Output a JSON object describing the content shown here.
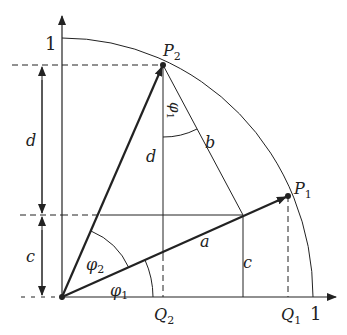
{
  "diagram": {
    "axis_labels": {
      "y_one": "1",
      "x_one": "1"
    },
    "points": {
      "P1": {
        "label": "P",
        "sub": "1"
      },
      "P2": {
        "label": "P",
        "sub": "2"
      },
      "Q1": {
        "label": "Q",
        "sub": "1"
      },
      "Q2": {
        "label": "Q",
        "sub": "2"
      }
    },
    "segments": {
      "a": "a",
      "b": "b",
      "c_left": "c",
      "c_right": "c",
      "d_left": "d",
      "d_mid": "d"
    },
    "angles": {
      "phi1": {
        "label": "φ",
        "sub": "1"
      },
      "phi2": {
        "label": "φ",
        "sub": "2"
      },
      "phi1_at_P2": {
        "label": "φ",
        "sub": "1"
      }
    },
    "colors": {
      "stroke": "#222222",
      "background": "#ffffff"
    }
  }
}
